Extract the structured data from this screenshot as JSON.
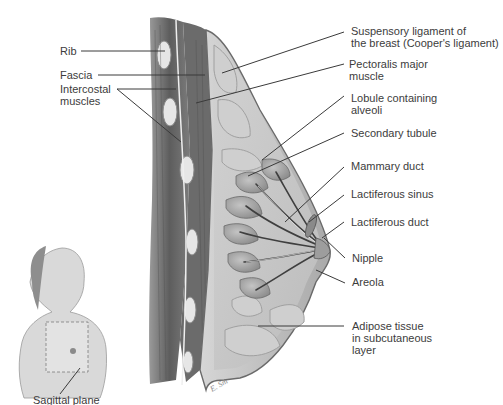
{
  "figure": {
    "type": "anatomical-illustration",
    "colors": {
      "line": "#3a3a3a",
      "text": "#3c3c3c",
      "tissue_light": "#d9d9d9",
      "tissue_mid": "#b5b5b5",
      "tissue_dark": "#6e6e6e",
      "muscle": "#7a7a7a",
      "background": "#ffffff"
    }
  },
  "labels_left": {
    "rib": "Rib",
    "fascia": "Fascia",
    "intercostal_1": "Intercostal",
    "intercostal_2": "muscles"
  },
  "labels_right": {
    "suspensory_1": "Suspensory ligament of",
    "suspensory_2": "the breast (Cooper's ligament)",
    "pectoralis_1": "Pectoralis major",
    "pectoralis_2": "muscle",
    "lobule_1": "Lobule containing",
    "lobule_2": "alveoli",
    "secondary_tubule": "Secondary tubule",
    "mammary_duct": "Mammary duct",
    "lactiferous_sinus": "Lactiferous sinus",
    "lactiferous_duct": "Lactiferous duct",
    "nipple": "Nipple",
    "areola": "Areola",
    "adipose_1": "Adipose tissue",
    "adipose_2": "in subcutaneous",
    "adipose_3": "layer"
  },
  "inset": {
    "caption": "Sagittal plane"
  }
}
